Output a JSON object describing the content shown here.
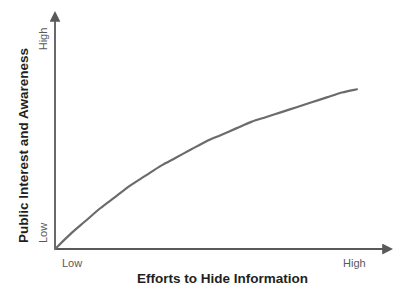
{
  "chart_data": {
    "type": "line",
    "title": "",
    "subtitle": "",
    "xlabel": "Efforts to Hide Information",
    "ylabel": "Public Interest and Awareness",
    "xticks": [
      "Low",
      "High"
    ],
    "yticks": [
      "Low",
      "High"
    ],
    "xlim": [
      0,
      100
    ],
    "ylim": [
      0,
      100
    ],
    "grid": false,
    "legend": null,
    "annotations": [],
    "line_color": "#6b6b6b",
    "line_width": 2,
    "axis_color": "#58595b",
    "background_color": "#ffffff",
    "series": [
      {
        "name": "Public interest response",
        "description": "Diminishing-returns (saturating) curve: interest rises steeply with initial concealment efforts, then plateaus.",
        "x": [
          0,
          5,
          10,
          15,
          20,
          25,
          30,
          35,
          40,
          45,
          50,
          55,
          60,
          65,
          70,
          75,
          80,
          85,
          90,
          95,
          100
        ],
        "y": [
          0,
          9,
          17,
          25,
          32,
          39,
          45,
          51,
          56,
          61,
          66,
          70,
          74,
          78,
          81,
          84,
          87,
          90,
          93,
          96,
          98
        ]
      }
    ]
  },
  "axes": {
    "y_title": "Public Interest and Awareness",
    "x_title": "Efforts to Hide Information",
    "y_tick_high": "High",
    "y_tick_low": "Low",
    "x_tick_low": "Low",
    "x_tick_high": "High"
  }
}
